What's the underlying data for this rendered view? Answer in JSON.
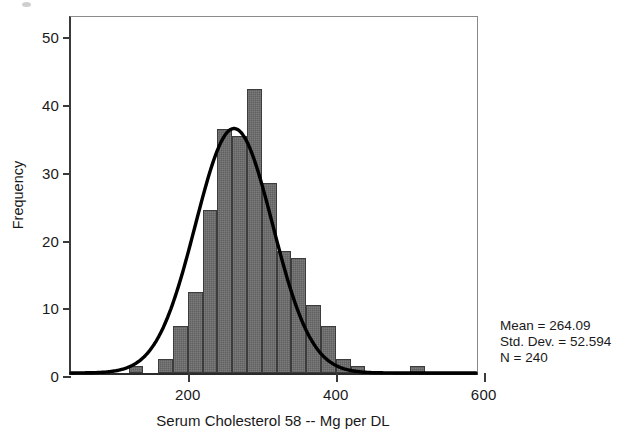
{
  "chart_data": {
    "type": "bar",
    "title": "",
    "subtitle": "",
    "xlabel": "Serum Cholesterol 58 -- Mg per DL",
    "ylabel": "Frequency",
    "xlim": [
      42,
      595
    ],
    "ylim": [
      0,
      53
    ],
    "xticks": [
      200,
      400,
      600
    ],
    "xtick_labels": [
      "200",
      "400",
      "600"
    ],
    "yticks": [
      0,
      10,
      20,
      30,
      40,
      50
    ],
    "ytick_labels": [
      "0",
      "10",
      "20",
      "30",
      "40",
      "50"
    ],
    "grid": false,
    "legend": false,
    "bin_width": 20,
    "bin_starts": [
      120,
      160,
      180,
      200,
      220,
      240,
      260,
      280,
      300,
      320,
      340,
      360,
      380,
      400,
      420,
      500
    ],
    "values": [
      1,
      2,
      7,
      12,
      24,
      36,
      35,
      42,
      28,
      18,
      17,
      10,
      7,
      2,
      1,
      1
    ],
    "bars": [
      {
        "bin_start": 120,
        "bin_end": 140,
        "height": 1
      },
      {
        "bin_start": 160,
        "bin_end": 180,
        "height": 2
      },
      {
        "bin_start": 180,
        "bin_end": 200,
        "height": 7
      },
      {
        "bin_start": 200,
        "bin_end": 220,
        "height": 12
      },
      {
        "bin_start": 220,
        "bin_end": 240,
        "height": 24
      },
      {
        "bin_start": 240,
        "bin_end": 260,
        "height": 36
      },
      {
        "bin_start": 260,
        "bin_end": 280,
        "height": 35
      },
      {
        "bin_start": 280,
        "bin_end": 300,
        "height": 42
      },
      {
        "bin_start": 300,
        "bin_end": 320,
        "height": 28
      },
      {
        "bin_start": 320,
        "bin_end": 340,
        "height": 18
      },
      {
        "bin_start": 340,
        "bin_end": 360,
        "height": 17
      },
      {
        "bin_start": 360,
        "bin_end": 380,
        "height": 10
      },
      {
        "bin_start": 380,
        "bin_end": 400,
        "height": 7
      },
      {
        "bin_start": 400,
        "bin_end": 420,
        "height": 2
      },
      {
        "bin_start": 420,
        "bin_end": 440,
        "height": 1
      },
      {
        "bin_start": 500,
        "bin_end": 520,
        "height": 1
      }
    ],
    "overlay_curve": {
      "name": "normal",
      "mean": 264.09,
      "std_dev": 52.594,
      "n": 240,
      "peak_frequency": 36.4,
      "color": "#000000"
    },
    "colors": {
      "bar_fill": "#6d6d6d",
      "bar_border": "#3c3c3c",
      "axis": "#2b2b2b",
      "curve": "#000000",
      "text": "#1a1a1a"
    }
  },
  "stats_box": {
    "mean_line": "Mean = 264.09",
    "std_dev_line": "Std. Dev. = 52.594",
    "n_line": "N = 240"
  }
}
